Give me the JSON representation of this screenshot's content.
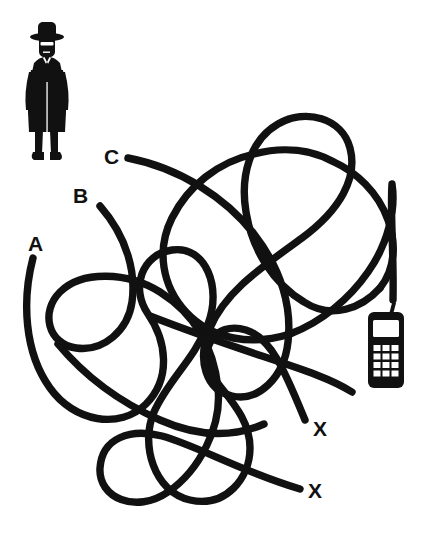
{
  "scene": {
    "title": "Tangled Lines Puzzle",
    "background_color": "#ffffff",
    "ink_color": "#111111",
    "width": 428,
    "height": 559
  },
  "actor": {
    "name": "detective-figure",
    "description": "Man in fedora hat, sunglasses and long trench coat",
    "position": {
      "x": 18,
      "y": 18,
      "width": 60,
      "height": 145
    }
  },
  "target": {
    "name": "mobile-phone",
    "description": "Classic mobile phone with antenna, screen and 4x4 keypad",
    "position": {
      "x": 368,
      "y": 310,
      "width": 36,
      "height": 78
    },
    "keypad_rows": 4,
    "keypad_cols": 3
  },
  "labels": [
    {
      "id": "A",
      "text": "A",
      "x": 28,
      "y": 251,
      "kind": "start"
    },
    {
      "id": "B",
      "text": "B",
      "x": 73,
      "y": 203,
      "kind": "start"
    },
    {
      "id": "C",
      "text": "C",
      "x": 104,
      "y": 164,
      "kind": "start"
    },
    {
      "id": "X1",
      "text": "X",
      "x": 313,
      "y": 436,
      "kind": "dead-end"
    },
    {
      "id": "X2",
      "text": "X",
      "x": 308,
      "y": 498,
      "kind": "dead-end"
    }
  ],
  "lines": [
    {
      "id": "line-a",
      "label": "A",
      "start": {
        "x": 33,
        "y": 258
      },
      "end_label": "X1",
      "path": "M 33 258 C 22 300 24 350 48 385 C 72 420 118 430 145 405 C 172 380 168 340 150 315 C 132 290 140 255 170 250 C 205 244 222 286 210 322 C 198 358 170 378 155 410 C 140 442 152 490 188 500 C 224 510 248 480 250 450 C 252 420 230 400 215 380 C 196 354 212 322 245 330 C 272 337 286 372 305 420"
    },
    {
      "id": "line-b",
      "label": "B",
      "start": {
        "x": 100,
        "y": 206
      },
      "end_label": "X2",
      "path": "M 100 206 C 126 236 134 272 130 300 C 126 328 104 350 76 346 C 48 342 42 312 60 292 C 80 270 126 272 158 292 C 196 316 212 350 216 386 C 220 424 200 468 168 492 C 136 516 100 500 100 470 C 100 440 128 428 160 436 C 196 445 240 472 300 489"
    },
    {
      "id": "line-c",
      "label": "C",
      "start": {
        "x": 128,
        "y": 158
      },
      "end_label": "phone",
      "path": "M 128 158 C 178 168 224 196 252 232 C 280 268 290 306 286 340 C 282 376 258 400 232 396 C 206 392 196 362 208 330 C 222 292 262 266 300 238 C 338 210 356 178 348 148 C 340 118 304 108 276 124 C 248 140 238 176 244 212 C 250 250 272 282 302 300 C 330 318 360 308 378 288 C 394 270 394 246 386 224 C 376 196 356 176 336 164"
    },
    {
      "id": "line-c-tail",
      "label": "C-tail",
      "note": "continuation of line C rising over the top arc and descending to the phone",
      "path": "M 336 164 C 316 152 288 146 258 152 C 222 159 190 184 174 216 C 158 248 164 284 186 310 C 210 338 250 346 288 334 C 326 322 356 296 376 268 C 396 240 400 208 392 182"
    },
    {
      "id": "line-phone-drop",
      "label": "phone-drop",
      "path": "M 392 182 C 396 212 396 254 393 300"
    }
  ],
  "answer_hint": {
    "correct_line": "C",
    "note": "Line C is the one that reaches the phone; A and B end at the X marks."
  }
}
